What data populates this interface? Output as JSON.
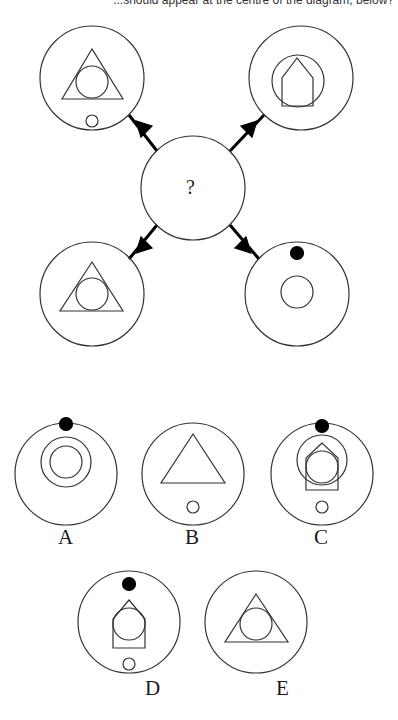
{
  "question": {
    "text": "...should appear at the centre of the diagram, below?"
  },
  "diagram": {
    "center": {
      "label": "?"
    },
    "inputs": [
      {
        "position": "top-left",
        "contents": [
          "outer-circle",
          "triangle",
          "inner-circle",
          "small-circle-bottom"
        ]
      },
      {
        "position": "top-right",
        "contents": [
          "outer-circle",
          "medium-circle",
          "house-pentagon"
        ]
      },
      {
        "position": "bottom-left",
        "contents": [
          "outer-circle",
          "triangle",
          "inner-circle"
        ]
      },
      {
        "position": "bottom-right",
        "contents": [
          "outer-circle",
          "black-dot-top",
          "inner-circle"
        ]
      }
    ],
    "arrow_style": "filled-arrowhead-pointing-to-center"
  },
  "options": [
    {
      "label": "A",
      "contents": [
        "outer-circle",
        "black-dot-top",
        "medium-circle",
        "inner-circle"
      ]
    },
    {
      "label": "B",
      "contents": [
        "outer-circle",
        "triangle",
        "small-circle-bottom"
      ]
    },
    {
      "label": "C",
      "contents": [
        "outer-circle",
        "black-dot-top",
        "medium-circle",
        "house-pentagon",
        "inner-circle",
        "small-circle-bottom"
      ]
    },
    {
      "label": "D",
      "contents": [
        "outer-circle",
        "black-dot-top",
        "house-pentagon",
        "inner-circle",
        "small-circle-bottom"
      ]
    },
    {
      "label": "E",
      "contents": [
        "outer-circle",
        "triangle",
        "inner-circle"
      ]
    }
  ],
  "colors": {
    "stroke": "#333333",
    "fill_dot": "#000000",
    "background": "#ffffff"
  }
}
